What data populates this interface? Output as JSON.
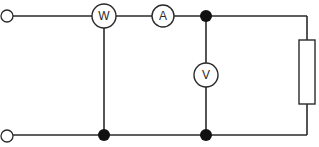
{
  "diagram": {
    "type": "electrical-circuit",
    "colors": {
      "line": "#2a2a2a",
      "junction": "#111111",
      "background": "#ffffff"
    },
    "terminals": [
      {
        "id": "input-top",
        "label": ""
      },
      {
        "id": "input-bottom",
        "label": ""
      }
    ],
    "meters": [
      {
        "id": "wattmeter",
        "symbol": "W"
      },
      {
        "id": "ammeter",
        "symbol": "A"
      },
      {
        "id": "voltmeter",
        "symbol": "V"
      }
    ],
    "load": {
      "id": "resistor",
      "label": ""
    },
    "junctions": [
      "top-after-ammeter",
      "bottom-wattmeter-return",
      "bottom-voltmeter-return"
    ]
  }
}
